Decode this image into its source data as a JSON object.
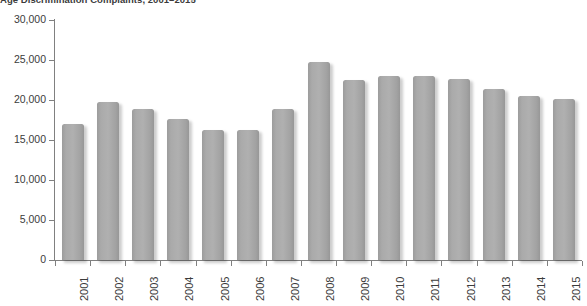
{
  "chart_data": {
    "type": "bar",
    "title": "Age Discrimination Complaints, 2001–2015",
    "xlabel": "",
    "ylabel": "",
    "ylim": [
      0,
      30000
    ],
    "grid": false,
    "legend": null,
    "categories": [
      "2001",
      "2002",
      "2003",
      "2004",
      "2005",
      "2006",
      "2007",
      "2008",
      "2009",
      "2010",
      "2011",
      "2012",
      "2013",
      "2014",
      "2015"
    ],
    "values": [
      17000,
      19750,
      18900,
      17600,
      16300,
      16300,
      18900,
      24700,
      22500,
      23000,
      23000,
      22600,
      21400,
      20500,
      20100
    ],
    "ytick_labels": [
      "0",
      "5,000",
      "10,000",
      "15,000",
      "20,000",
      "25,000",
      "30,000"
    ],
    "ytick_values": [
      0,
      5000,
      10000,
      15000,
      20000,
      25000,
      30000
    ],
    "bar_color": "#a8a8a8",
    "axis_color": "#808080",
    "text_color": "#3b3b3b",
    "background": "#ffffff"
  }
}
